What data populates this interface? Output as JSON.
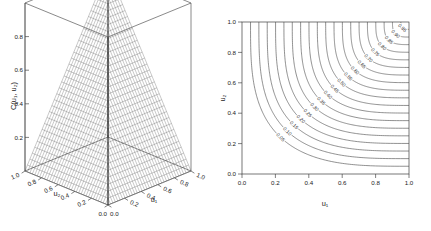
{
  "figure": {
    "background": "#ffffff",
    "line_color": "#4a4a4a",
    "panel_count": 2
  },
  "surface_panel": {
    "z_axis_label": "C(u₁, u₂)",
    "z_ticks": [
      "0.2",
      "0.4",
      "0.6",
      "0.8"
    ],
    "u1_axis_label": "u₁",
    "u1_ticks": [
      "0.0",
      "0.2",
      "0.4",
      "0.6",
      "0.8",
      "1.0"
    ],
    "u2_axis_label": "u₂",
    "u2_ticks": [
      "1.0",
      "0.8",
      "0.6",
      "0.4",
      "0.2",
      "0.0"
    ],
    "origin_label_left": "0.0",
    "origin_label_right": "0.0"
  },
  "contour_panel": {
    "x_axis_label": "u₁",
    "y_axis_label": "u₂",
    "x_ticks": [
      "0.0",
      "0.2",
      "0.4",
      "0.6",
      "0.8",
      "1.0"
    ],
    "y_ticks": [
      "0.0",
      "0.2",
      "0.4",
      "0.6",
      "0.8",
      "1.0"
    ]
  },
  "chart_data": [
    {
      "type": "surface",
      "title": "",
      "xlabel": "u₁",
      "ylabel": "u₂",
      "zlabel": "C(u₁, u₂)",
      "function": "C(u1,u2) = min(u1, u2)",
      "xlim": [
        0,
        1
      ],
      "ylim": [
        0,
        1
      ],
      "zlim": [
        0,
        1
      ],
      "grid": true,
      "mesh_resolution": 34,
      "xticks": [
        0.0,
        0.2,
        0.4,
        0.6,
        0.8,
        1.0
      ],
      "yticks": [
        0.0,
        0.2,
        0.4,
        0.6,
        0.8,
        1.0
      ],
      "zticks": [
        0.2,
        0.4,
        0.6,
        0.8
      ],
      "legend": "none",
      "notes": "Wireframe mesh pyramid rising to apex at back corner (u1=u2=1); ridge along the diagonal u1=u2; bounding box drawn."
    },
    {
      "type": "contour",
      "title": "",
      "xlabel": "u₁",
      "ylabel": "u₂",
      "function": "C(u1,u2) = min(u1, u2)",
      "xlim": [
        0,
        1
      ],
      "ylim": [
        0,
        1
      ],
      "grid": false,
      "legend": "inline-labels",
      "xticks": [
        0.0,
        0.2,
        0.4,
        0.6,
        0.8,
        1.0
      ],
      "yticks": [
        0.0,
        0.2,
        0.4,
        0.6,
        0.8,
        1.0
      ],
      "levels": [
        0.05,
        0.1,
        0.15,
        0.2,
        0.25,
        0.3,
        0.35,
        0.4,
        0.45,
        0.5,
        0.55,
        0.6,
        0.65,
        0.7,
        0.75,
        0.8,
        0.85,
        0.9,
        0.95
      ],
      "level_labels": [
        "0.05",
        "0.10",
        "0.15",
        "0.20",
        "0.25",
        "0.30",
        "0.35",
        "0.40",
        "0.45",
        "0.50",
        "0.55",
        "0.60",
        "0.65",
        "0.70",
        "0.75",
        "0.80",
        "0.85",
        "0.90",
        "0.95"
      ],
      "notes": "Rounded L-shaped (hyperbola-like) level curves, asymptotic to u1=level and u2=level; labels set inline along each curve."
    }
  ]
}
